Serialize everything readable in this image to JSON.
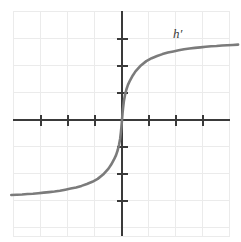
{
  "figure": {
    "background_color": "#ffffff",
    "width": 241,
    "height": 242
  },
  "annotations": {
    "curve_label": "h′"
  },
  "chart_data": {
    "type": "line",
    "title": "",
    "subtitle": "",
    "xlabel": "",
    "ylabel": "",
    "legend": [
      "h′"
    ],
    "legend_position": "inline-upper-right",
    "grid": true,
    "grid_color": "#ebebeb",
    "grid_spacing_units": 1,
    "axis_color": "#3a3a3a",
    "curve_color": "#7b7b7b",
    "xlim": [
      -4.1,
      4.4
    ],
    "ylim": [
      -4.1,
      4.1
    ],
    "xticks": [
      -3,
      -2,
      -1,
      1,
      2,
      3
    ],
    "yticks": [
      -3,
      -2,
      -1,
      1,
      2,
      3
    ],
    "xtick_labels": [
      "",
      "",
      "",
      "",
      "",
      ""
    ],
    "ytick_labels": [
      "",
      "",
      "",
      "",
      "",
      ""
    ],
    "series": [
      {
        "name": "h′",
        "x": [
          -4.1,
          -3.9,
          -3.7,
          -3.5,
          -3.3,
          -3.1,
          -2.9,
          -2.7,
          -2.5,
          -2.3,
          -2.1,
          -1.9,
          -1.7,
          -1.5,
          -1.3,
          -1.1,
          -0.9,
          -0.7,
          -0.5,
          -0.4,
          -0.3,
          -0.22,
          -0.16,
          -0.11,
          -0.07,
          -0.04,
          -0.02,
          0.0,
          0.02,
          0.04,
          0.07,
          0.11,
          0.16,
          0.22,
          0.3,
          0.4,
          0.5,
          0.7,
          0.9,
          1.1,
          1.3,
          1.5,
          1.7,
          1.9,
          2.1,
          2.3,
          2.5,
          2.7,
          2.9,
          3.1,
          3.3,
          3.5,
          3.7,
          3.9,
          4.1,
          4.3
        ],
        "y": [
          -2.78,
          -2.77,
          -2.76,
          -2.74,
          -2.73,
          -2.71,
          -2.69,
          -2.67,
          -2.65,
          -2.62,
          -2.58,
          -2.54,
          -2.5,
          -2.44,
          -2.37,
          -2.29,
          -2.18,
          -2.02,
          -1.8,
          -1.65,
          -1.47,
          -1.3,
          -1.12,
          -0.92,
          -0.7,
          -0.45,
          -0.25,
          0.0,
          0.25,
          0.45,
          0.7,
          0.92,
          1.12,
          1.3,
          1.47,
          1.65,
          1.8,
          2.02,
          2.18,
          2.29,
          2.37,
          2.44,
          2.5,
          2.54,
          2.58,
          2.62,
          2.65,
          2.67,
          2.69,
          2.71,
          2.73,
          2.74,
          2.76,
          2.77,
          2.78,
          2.79
        ]
      }
    ]
  }
}
